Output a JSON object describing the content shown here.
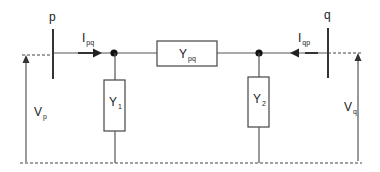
{
  "diagram": {
    "title": "",
    "buses": [
      {
        "id": "p",
        "label": "p"
      },
      {
        "id": "q",
        "label": "q"
      }
    ],
    "currents": [
      {
        "main": "I",
        "sub": "pq",
        "direction": "right"
      },
      {
        "main": "I",
        "sub": "qp",
        "direction": "left"
      }
    ],
    "series_admittance": {
      "main": "Y",
      "sub": "pq"
    },
    "shunt_admittances": [
      {
        "main": "Y",
        "sub": "1"
      },
      {
        "main": "Y",
        "sub": "2"
      }
    ],
    "voltages": [
      {
        "main": "V",
        "sub": "p"
      },
      {
        "main": "V",
        "sub": "q"
      }
    ],
    "colors": {
      "line": "#555555",
      "bus": "#333333",
      "text": "#222222"
    }
  }
}
